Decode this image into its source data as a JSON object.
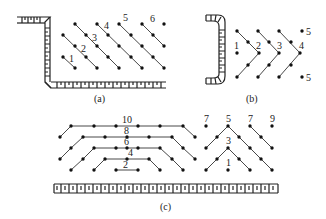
{
  "figures": [
    {
      "id": "a",
      "caption": "(a)",
      "labels": [
        "1",
        "2",
        "3",
        "4",
        "5",
        "6"
      ]
    },
    {
      "id": "b",
      "caption": "(b)",
      "labels": [
        "1",
        "2",
        "3",
        "4",
        "5",
        "5"
      ]
    },
    {
      "id": "c",
      "caption": "(c)",
      "labels_left": [
        "10",
        "8",
        "6",
        "4",
        "2"
      ],
      "labels_right": [
        "7",
        "5",
        "7",
        "9",
        "3",
        "1"
      ]
    }
  ]
}
